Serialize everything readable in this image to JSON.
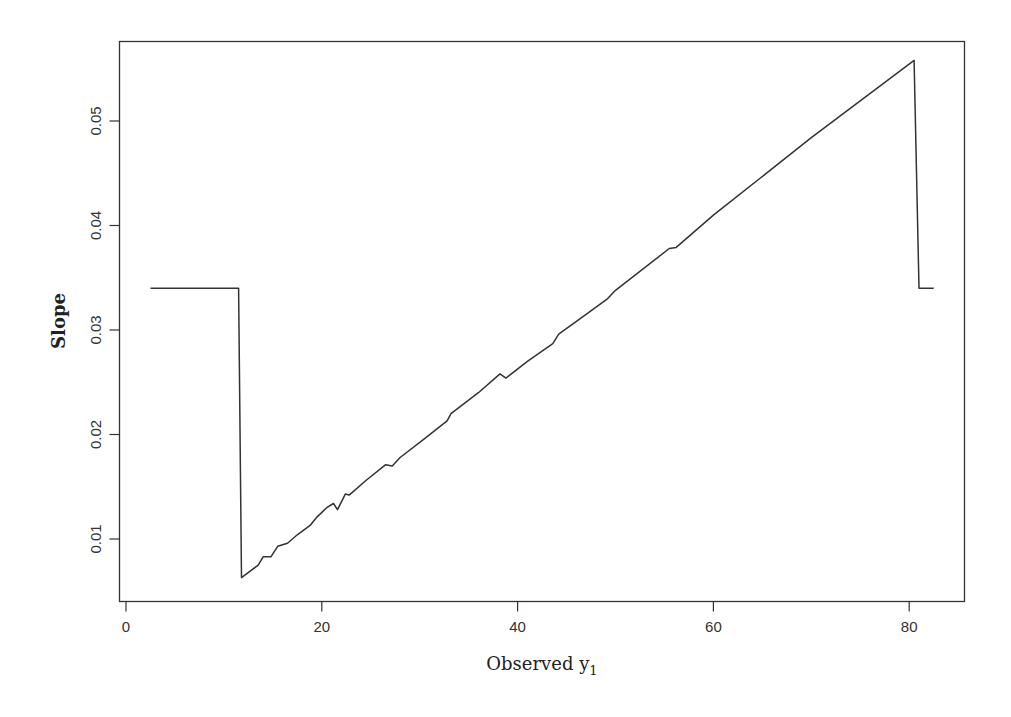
{
  "chart_data": {
    "type": "line",
    "title": "",
    "xlabel": "Observed y",
    "xlabel_subscript": "1",
    "ylabel": "Slope",
    "xlim": [
      -0.7,
      85.7
    ],
    "ylim": [
      0.0045,
      0.0586
    ],
    "x_ticks": [
      0,
      20,
      40,
      60,
      80
    ],
    "x_tick_labels": [
      "0",
      "20",
      "40",
      "60",
      "80"
    ],
    "y_ticks": [
      0.01,
      0.02,
      0.03,
      0.04,
      0.05
    ],
    "y_tick_labels": [
      "0.01",
      "0.02",
      "0.03",
      "0.04",
      "0.05"
    ],
    "grid": false,
    "legend": null,
    "series": [
      {
        "name": "Slope",
        "color": "#333333",
        "points": [
          [
            2.5,
            0.034
          ],
          [
            11.5,
            0.034
          ],
          [
            11.8,
            0.0063
          ],
          [
            13.5,
            0.0075
          ],
          [
            14.0,
            0.0083
          ],
          [
            14.8,
            0.0083
          ],
          [
            15.5,
            0.0093
          ],
          [
            16.5,
            0.0096
          ],
          [
            17.5,
            0.0104
          ],
          [
            18.8,
            0.0113
          ],
          [
            19.5,
            0.0121
          ],
          [
            20.5,
            0.013
          ],
          [
            21.2,
            0.0134
          ],
          [
            21.6,
            0.0128
          ],
          [
            22.4,
            0.0143
          ],
          [
            22.8,
            0.0142
          ],
          [
            24.5,
            0.0156
          ],
          [
            26.5,
            0.0171
          ],
          [
            27.2,
            0.017
          ],
          [
            28.0,
            0.0178
          ],
          [
            30.5,
            0.0196
          ],
          [
            32.8,
            0.0213
          ],
          [
            33.2,
            0.022
          ],
          [
            36.0,
            0.024
          ],
          [
            38.2,
            0.0258
          ],
          [
            38.8,
            0.0254
          ],
          [
            41.0,
            0.027
          ],
          [
            43.6,
            0.0287
          ],
          [
            44.2,
            0.0296
          ],
          [
            47.0,
            0.0315
          ],
          [
            49.2,
            0.033
          ],
          [
            50.0,
            0.0338
          ],
          [
            55.5,
            0.0378
          ],
          [
            56.2,
            0.0379
          ],
          [
            60.0,
            0.041
          ],
          [
            70.0,
            0.0484
          ],
          [
            80.5,
            0.0558
          ],
          [
            81.0,
            0.034
          ],
          [
            82.5,
            0.034
          ]
        ]
      }
    ]
  },
  "axes": {
    "x_title": "Observed y",
    "x_title_sub": "1",
    "y_title": "Slope"
  }
}
